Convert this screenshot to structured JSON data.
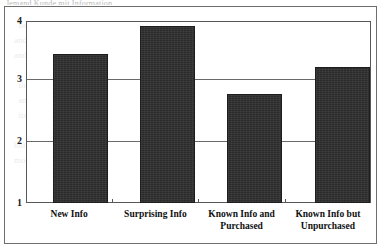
{
  "page": {
    "scan_top_text_fragment": "Jemand Kunde mit Information",
    "ghost_text": "  below the bar are a distribution with a power of the attributes\nand support the for they won the decision tended to chosen consumer\nand another to  for the  post information  providing  affecting a\n\n  that is the  for the  attribute group of  the  new information  on\n  and consumers  a new  the  product  which  is  most  clear  and\n  its  Appendix  the  post  2  specific  Appendix  to  analysis  is  a\n\nbut  the  full  within  value  accounting  to  trial  to  rely  on  it.  A  com\nmodel  of  the  effects  of  making  and  the  way  of  the  terms  the  reconsidering"
  },
  "chart_data": {
    "type": "bar",
    "title": "",
    "xlabel": "",
    "ylabel": "",
    "categories": [
      "New Info",
      "Surprising Info",
      "Known Info and Purchased",
      "Known Info but Unpurchased"
    ],
    "category_lines": [
      [
        "New Info"
      ],
      [
        "Surprising Info"
      ],
      [
        "Known Info and",
        "Purchased"
      ],
      [
        "Known Info but",
        "Unpurchased"
      ]
    ],
    "values": [
      3.45,
      3.92,
      2.8,
      3.25
    ],
    "ylim": [
      1,
      4
    ],
    "yticks": [
      1,
      2,
      3,
      4
    ],
    "ytick_labels": [
      "1",
      "2",
      "3",
      "4"
    ],
    "grid": true,
    "legend": false,
    "bar_color": "#2b2b2b",
    "plot_background": "#ffffff",
    "axis_color": "#585858"
  }
}
